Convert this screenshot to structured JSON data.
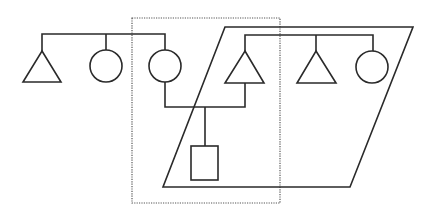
{
  "diagram": {
    "type": "kinship-diagram",
    "colors": {
      "stroke": "#2a2a2a",
      "background": "#ffffff",
      "dotted_box": "#555555"
    },
    "left_sibship": [
      {
        "symbol": "triangle",
        "meaning": "male"
      },
      {
        "symbol": "circle",
        "meaning": "female"
      },
      {
        "symbol": "circle",
        "meaning": "female",
        "role": "wife"
      }
    ],
    "right_sibship": [
      {
        "symbol": "triangle",
        "meaning": "male",
        "role": "husband"
      },
      {
        "symbol": "triangle",
        "meaning": "male"
      },
      {
        "symbol": "circle",
        "meaning": "female"
      }
    ],
    "child": {
      "symbol": "square",
      "meaning": "child"
    },
    "enclosures": [
      {
        "shape": "dotted-rectangle",
        "contains": [
          "wife",
          "husband",
          "child"
        ]
      },
      {
        "shape": "parallelogram",
        "contains": [
          "right_sibship",
          "child"
        ]
      }
    ]
  }
}
